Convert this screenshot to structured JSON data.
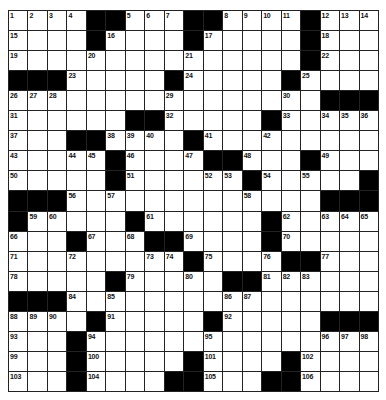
{
  "puzzle": {
    "rows": 19,
    "cols": 19,
    "colors": {
      "block": "#000000",
      "cell": "#ffffff",
      "gridline": "#222222",
      "number": "#111111"
    },
    "grid": [
      [
        "1",
        "2",
        "3",
        "4",
        "#",
        "#",
        "5",
        "6",
        "7",
        "#",
        "#",
        "8",
        "9",
        "10",
        "11",
        "#",
        "12",
        "13",
        "14"
      ],
      [
        "15",
        "",
        "",
        "",
        "#",
        "16",
        "",
        "",
        "",
        "#",
        "17",
        "",
        "",
        "",
        "",
        "#",
        "18",
        "",
        ""
      ],
      [
        "19",
        "",
        "",
        "",
        "20",
        "",
        "",
        "",
        "",
        "21",
        "",
        "",
        "",
        "",
        "",
        "#",
        "22",
        "",
        ""
      ],
      [
        "#",
        "#",
        "#",
        "23",
        "",
        "",
        "",
        "",
        "#",
        "24",
        "",
        "",
        "",
        "",
        "#",
        "25",
        "",
        "",
        ""
      ],
      [
        "26",
        "27",
        "28",
        "",
        "",
        "",
        "",
        "",
        "29",
        "",
        "",
        "",
        "",
        "",
        "30",
        "",
        "#",
        "#",
        "#"
      ],
      [
        "31",
        "",
        "",
        "",
        "",
        "",
        "#",
        "#",
        "32",
        "",
        "",
        "",
        "",
        "#",
        "33",
        "",
        "34",
        "35",
        "36"
      ],
      [
        "37",
        "",
        "",
        "#",
        "#",
        "38",
        "39",
        "40",
        "",
        "#",
        "41",
        "",
        "",
        "42",
        "",
        "",
        "",
        "",
        ""
      ],
      [
        "43",
        "",
        "",
        "44",
        "45",
        "#",
        "46",
        "",
        "",
        "47",
        "#",
        "#",
        "48",
        "",
        "",
        "#",
        "49",
        "",
        ""
      ],
      [
        "50",
        "",
        "",
        "",
        "",
        "#",
        "51",
        "",
        "",
        "",
        "52",
        "53",
        "#",
        "54",
        "",
        "55",
        "",
        "",
        "#"
      ],
      [
        "#",
        "#",
        "#",
        "56",
        "",
        "57",
        "",
        "",
        "",
        "",
        "",
        "",
        "58",
        "",
        "",
        "",
        "#",
        "#",
        "#"
      ],
      [
        "#",
        "59",
        "60",
        "",
        "",
        "",
        "#",
        "61",
        "",
        "",
        "",
        "",
        "",
        "#",
        "62",
        "",
        "63",
        "64",
        "65"
      ],
      [
        "66",
        "",
        "",
        "#",
        "67",
        "",
        "68",
        "#",
        "#",
        "69",
        "",
        "",
        "",
        "#",
        "70",
        "",
        "",
        "",
        ""
      ],
      [
        "71",
        "",
        "",
        "72",
        "",
        "",
        "",
        "73",
        "74",
        "#",
        "75",
        "",
        "",
        "76",
        "#",
        "#",
        "77",
        "",
        ""
      ],
      [
        "78",
        "",
        "",
        "",
        "",
        "#",
        "79",
        "",
        "",
        "80",
        "",
        "#",
        "#",
        "81",
        "82",
        "83",
        "",
        "",
        ""
      ],
      [
        "#",
        "#",
        "#",
        "84",
        "",
        "85",
        "",
        "",
        "",
        "",
        "",
        "86",
        "87",
        "",
        "",
        "",
        "",
        "",
        ""
      ],
      [
        "88",
        "89",
        "90",
        "",
        "#",
        "91",
        "",
        "",
        "",
        "",
        "#",
        "92",
        "",
        "",
        "",
        "",
        "#",
        "#",
        "#"
      ],
      [
        "93",
        "",
        "",
        "#",
        "94",
        "",
        "",
        "",
        "",
        "",
        "95",
        "",
        "",
        "",
        "",
        "",
        "96",
        "97",
        "98"
      ],
      [
        "99",
        "",
        "",
        "#",
        "100",
        "",
        "",
        "",
        "",
        "#",
        "101",
        "",
        "",
        "",
        "#",
        "102",
        "",
        "",
        ""
      ],
      [
        "103",
        "",
        "",
        "#",
        "104",
        "",
        "",
        "",
        "#",
        "#",
        "105",
        "",
        "",
        "#",
        "#",
        "106",
        "",
        "",
        ""
      ]
    ]
  }
}
